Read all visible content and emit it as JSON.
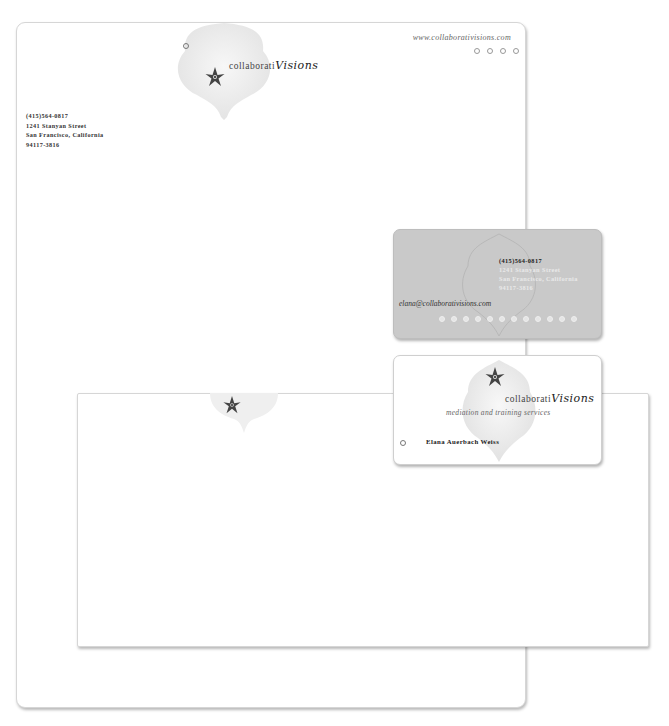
{
  "letterhead": {
    "brand_prefix": "collaborati",
    "brand_suffix": "Visions",
    "url": "www.collaborativisions.com",
    "address": [
      "(415)564-0817",
      "1241 Stanyan Street",
      "San Francisco, California",
      "94117-3816"
    ],
    "dot_count": 4
  },
  "business_card_back": {
    "phone": "(415)564-0817",
    "address": [
      "1241 Stanyan Street",
      "San Francisco, California",
      "94117-3816"
    ],
    "email": "elana@collaborativisions.com",
    "dot_count": 12
  },
  "business_card_front": {
    "brand_prefix": "collaborati",
    "brand_suffix": "Visions",
    "tagline": "mediation and training services",
    "name": "Elana Auerbach Weiss"
  },
  "envelope": {},
  "caption": "Collaborati Visions identity",
  "colors": {
    "card_gray": "#c9c9c9",
    "flower": "#3a3a3a",
    "blob": "#efefef"
  }
}
